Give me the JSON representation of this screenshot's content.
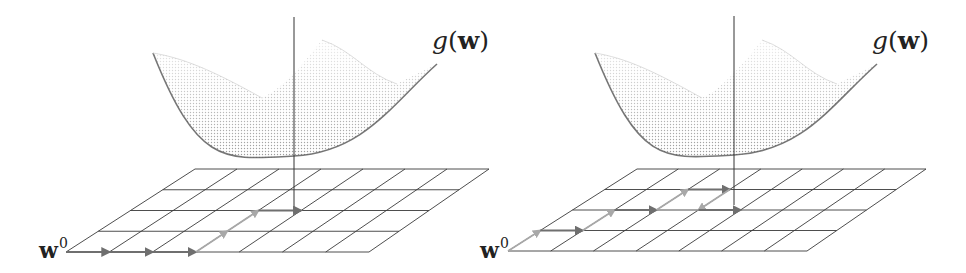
{
  "figure": {
    "panels": [
      {
        "id": "left",
        "function_label": {
          "name": "g",
          "open": "(",
          "arg": "w",
          "close": ")",
          "x": 432,
          "y": 28
        },
        "start_label": {
          "base": "w",
          "sup": "0",
          "x": 39,
          "y": 236
        },
        "axis": {
          "x": 294,
          "y_top": 17,
          "y_bottom": 213
        },
        "bowl": {
          "left": [
            153,
            53
          ],
          "right": [
            437,
            64
          ],
          "bottom": [
            294,
            156
          ],
          "back_peak": [
            322,
            40
          ]
        },
        "grid": {
          "bottom_left": [
            66,
            252
          ],
          "bottom_right": [
            369,
            252
          ],
          "top_left": [
            195,
            169
          ],
          "top_right": [
            489,
            169
          ],
          "cols": 7,
          "rows": 4
        },
        "path": [
          {
            "from": [
              0,
              0
            ],
            "to": [
              1,
              0
            ],
            "shade": "dark"
          },
          {
            "from": [
              1,
              0
            ],
            "to": [
              2,
              0
            ],
            "shade": "dark"
          },
          {
            "from": [
              2,
              0
            ],
            "to": [
              3,
              0
            ],
            "shade": "dark"
          },
          {
            "from": [
              3,
              0
            ],
            "to": [
              3,
              1
            ],
            "shade": "light"
          },
          {
            "from": [
              3,
              1
            ],
            "to": [
              3,
              2
            ],
            "shade": "light"
          },
          {
            "from": [
              3,
              2
            ],
            "to": [
              4,
              2
            ],
            "shade": "dark"
          }
        ]
      },
      {
        "id": "right",
        "function_label": {
          "name": "g",
          "open": "(",
          "arg": "w",
          "close": ")",
          "x": 872,
          "y": 28
        },
        "start_label": {
          "base": "w",
          "sup": "0",
          "x": 480,
          "y": 236
        },
        "axis": {
          "x": 734,
          "y_top": 16,
          "y_bottom": 205
        },
        "bowl": {
          "left": [
            595,
            53
          ],
          "right": [
            877,
            64
          ],
          "bottom": [
            734,
            155
          ],
          "back_peak": [
            762,
            40
          ]
        },
        "grid": {
          "bottom_left": [
            508,
            251
          ],
          "bottom_right": [
            807,
            251
          ],
          "top_left": [
            637,
            169
          ],
          "top_right": [
            926,
            169
          ],
          "cols": 7,
          "rows": 4
        },
        "path": [
          {
            "from": [
              0,
              0
            ],
            "to": [
              0,
              1
            ],
            "shade": "light"
          },
          {
            "from": [
              0,
              1
            ],
            "to": [
              1,
              1
            ],
            "shade": "dark"
          },
          {
            "from": [
              1,
              1
            ],
            "to": [
              1,
              2
            ],
            "shade": "light"
          },
          {
            "from": [
              1,
              2
            ],
            "to": [
              2,
              2
            ],
            "shade": "dark"
          },
          {
            "from": [
              2,
              2
            ],
            "to": [
              2,
              3
            ],
            "shade": "light"
          },
          {
            "from": [
              2,
              3
            ],
            "to": [
              3,
              3
            ],
            "shade": "dark"
          },
          {
            "from": [
              3,
              3
            ],
            "to": [
              3,
              2
            ],
            "shade": "light"
          },
          {
            "from": [
              3,
              2
            ],
            "to": [
              4,
              2
            ],
            "shade": "dark"
          }
        ]
      }
    ],
    "colors": {
      "grid_line": "#3a3a3a",
      "axis_line": "#333333",
      "arrow_dark": "#6f6f6f",
      "arrow_light": "#a8a8a8",
      "bowl_dark": "#555555",
      "bowl_light": "#d4d4d4",
      "text": "#222222"
    }
  }
}
